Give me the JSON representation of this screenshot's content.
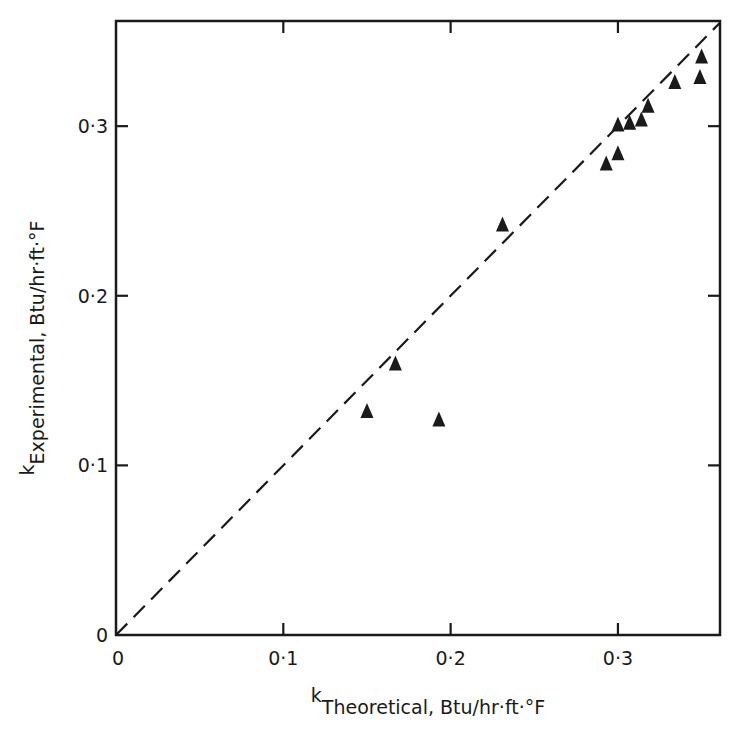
{
  "chart_data": {
    "type": "scatter",
    "title": "",
    "xlabel": {
      "symbol": "k",
      "subscript": "Theoretical, Btu/hr·ft·°F"
    },
    "ylabel": {
      "symbol": "k",
      "subscript": "Experimental, Btu/hr·ft·°F"
    },
    "xlim": [
      0,
      0.361
    ],
    "ylim": [
      0,
      0.362
    ],
    "x_ticks": [
      0,
      0.1,
      0.2,
      0.3
    ],
    "x_tick_labels": [
      "0",
      "0·1",
      "0·2",
      "0·3"
    ],
    "y_ticks": [
      0,
      0.1,
      0.2,
      0.3
    ],
    "y_tick_labels": [
      "0",
      "0·1",
      "0·2",
      "0·3"
    ],
    "grid": false,
    "legend": null,
    "marker": "filled-triangle",
    "series": [
      {
        "name": "measured",
        "points": [
          {
            "x": 0.15,
            "y": 0.132
          },
          {
            "x": 0.167,
            "y": 0.16
          },
          {
            "x": 0.193,
            "y": 0.127
          },
          {
            "x": 0.231,
            "y": 0.242
          },
          {
            "x": 0.293,
            "y": 0.278
          },
          {
            "x": 0.3,
            "y": 0.284
          },
          {
            "x": 0.3,
            "y": 0.301
          },
          {
            "x": 0.307,
            "y": 0.302
          },
          {
            "x": 0.314,
            "y": 0.304
          },
          {
            "x": 0.318,
            "y": 0.312
          },
          {
            "x": 0.334,
            "y": 0.326
          },
          {
            "x": 0.349,
            "y": 0.329
          },
          {
            "x": 0.35,
            "y": 0.341
          }
        ]
      }
    ],
    "reference_line": {
      "type": "y=x",
      "style": "dashed",
      "from": [
        0,
        0
      ],
      "to": [
        0.361,
        0.361
      ]
    }
  },
  "layout": {
    "plot": {
      "left": 116,
      "top": 21,
      "right": 720,
      "bottom": 635
    },
    "ink_color": "#1a1a1a"
  }
}
